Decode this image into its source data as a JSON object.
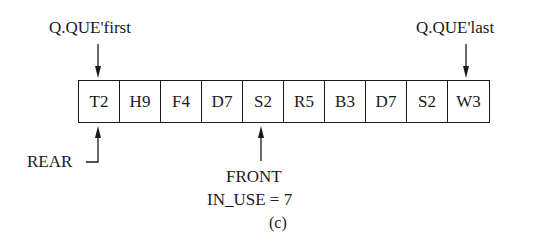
{
  "figure": {
    "caption": "(c)",
    "array_cells": [
      "T2",
      "H9",
      "F4",
      "D7",
      "S2",
      "R5",
      "B3",
      "D7",
      "S2",
      "W3"
    ],
    "labels": {
      "first": "Q.QUE'first",
      "last": "Q.QUE'last",
      "rear": "REAR",
      "front": "FRONT",
      "in_use": "IN_USE = 7"
    }
  }
}
